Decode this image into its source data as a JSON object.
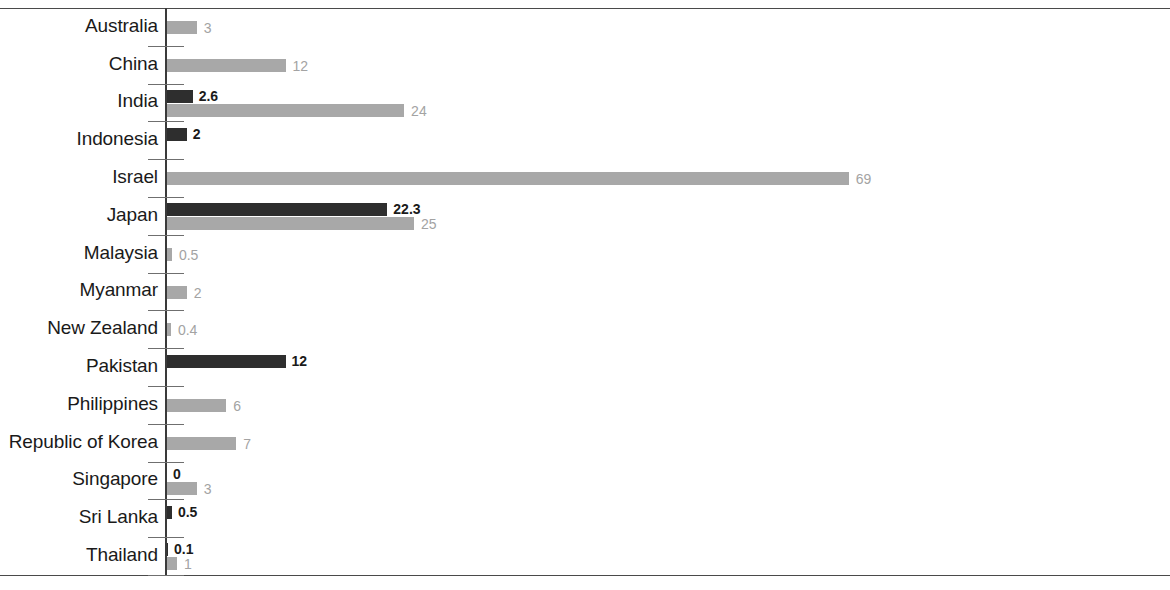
{
  "chart_data": {
    "type": "bar",
    "orientation": "horizontal",
    "title": "",
    "subtitle": "",
    "xlabel": "",
    "ylabel": "",
    "grid": false,
    "legend_position": "none",
    "xlim": [
      0,
      101
    ],
    "axis_ticks_visible": true,
    "x_tick_labels": [],
    "colors": {
      "series_dark": "#2e2e2e",
      "series_light": "#a8a8a8",
      "axis": "#3a3a3a",
      "label_dark": "#1a1a1a",
      "label_light": "#a3a3a3"
    },
    "categories": [
      "Australia",
      "China",
      "India",
      "Indonesia",
      "Israel",
      "Japan",
      "Malaysia",
      "Myanmar",
      "New Zealand",
      "Pakistan",
      "Philippines",
      "Republic of Korea",
      "Singapore",
      "Sri Lanka",
      "Thailand"
    ],
    "series": [
      {
        "name": "series-dark",
        "color": "#2e2e2e",
        "values": [
          null,
          null,
          2.6,
          2,
          null,
          22.3,
          null,
          null,
          null,
          12,
          null,
          null,
          0,
          0.5,
          0.1
        ],
        "labels": [
          "",
          "",
          "2.6",
          "2",
          "",
          "22.3",
          "",
          "",
          "",
          "12",
          "",
          "",
          "0",
          "0.5",
          "0.1"
        ]
      },
      {
        "name": "series-light",
        "color": "#a8a8a8",
        "values": [
          3,
          12,
          24,
          null,
          69,
          25,
          0.5,
          2,
          0.4,
          null,
          6,
          7,
          3,
          null,
          1
        ],
        "labels": [
          "3",
          "12",
          "24",
          "",
          "69",
          "25",
          "0.5",
          "2",
          "0.4",
          "",
          "6",
          "7",
          "3",
          "",
          "1"
        ]
      }
    ],
    "rows": [
      {
        "category": "Australia",
        "dark": null,
        "dark_label": "",
        "light": 3,
        "light_label": "3"
      },
      {
        "category": "China",
        "dark": null,
        "dark_label": "",
        "light": 12,
        "light_label": "12"
      },
      {
        "category": "India",
        "dark": 2.6,
        "dark_label": "2.6",
        "light": 24,
        "light_label": "24"
      },
      {
        "category": "Indonesia",
        "dark": 2,
        "dark_label": "2",
        "light": null,
        "light_label": ""
      },
      {
        "category": "Israel",
        "dark": null,
        "dark_label": "",
        "light": 69,
        "light_label": "69"
      },
      {
        "category": "Japan",
        "dark": 22.3,
        "dark_label": "22.3",
        "light": 25,
        "light_label": "25"
      },
      {
        "category": "Malaysia",
        "dark": null,
        "dark_label": "",
        "light": 0.5,
        "light_label": "0.5"
      },
      {
        "category": "Myanmar",
        "dark": null,
        "dark_label": "",
        "light": 2,
        "light_label": "2"
      },
      {
        "category": "New Zealand",
        "dark": null,
        "dark_label": "",
        "light": 0.4,
        "light_label": "0.4"
      },
      {
        "category": "Pakistan",
        "dark": 12,
        "dark_label": "12",
        "light": null,
        "light_label": ""
      },
      {
        "category": "Philippines",
        "dark": null,
        "dark_label": "",
        "light": 6,
        "light_label": "6"
      },
      {
        "category": "Republic of Korea",
        "dark": null,
        "dark_label": "",
        "light": 7,
        "light_label": "7"
      },
      {
        "category": "Singapore",
        "dark": 0,
        "dark_label": "0",
        "light": 3,
        "light_label": "3"
      },
      {
        "category": "Sri Lanka",
        "dark": 0.5,
        "dark_label": "0.5",
        "light": null,
        "light_label": ""
      },
      {
        "category": "Thailand",
        "dark": 0.1,
        "dark_label": "0.1",
        "light": 1,
        "light_label": "1"
      }
    ]
  }
}
